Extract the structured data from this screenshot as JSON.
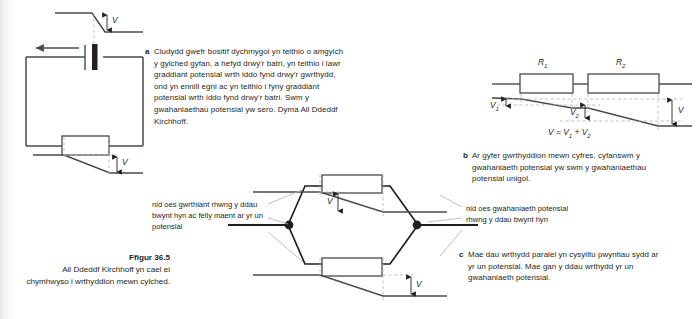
{
  "figure": {
    "caption_title": "Ffigur 36.5",
    "caption_body": "Ail Ddeddf Kirchhoff yn cael ei chymhwyso i wrthyddion mewn cylched."
  },
  "sections": {
    "a": {
      "marker": "a",
      "text": "Cludydd gwefr bositif dychmygol yn teithio o amgylch y gylched gyfan, a hefyd drwy'r batri, yn teithio i lawr graddiant potensial wrth iddo fynd drwy'r gwrthydd, ond yn ennill egni ac yn teithio i fyny graddiant potensial wrth iddo fynd drwy'r batri. Swm y gwahaniaethau potensial yw sero. Dyma Ail Ddeddf Kirchhoff."
    },
    "b": {
      "marker": "b",
      "text": "Ar gyfer gwrthyddion mewn cyfres, cyfanswm y gwahaniaeth potensial yw swm y gwahaniaethau potensial unigol."
    },
    "c": {
      "marker": "c",
      "text": "Mae dau wrthydd paralel yn cysylltu pwyntiau sydd ar yr un potensial. Mae gan y ddau wrthydd yr un gwahaniaeth potensial."
    }
  },
  "diagram_a": {
    "v_label_top": "V",
    "v_label_bottom": "V"
  },
  "diagram_b": {
    "resistor_1_label": "R",
    "resistor_1_sub": "1",
    "resistor_2_label": "R",
    "resistor_2_sub": "2",
    "v1_label": "V",
    "v1_sub": "1",
    "v2_label": "V",
    "v2_sub": "2",
    "v_total_label": "V",
    "equation_lhs": "V",
    "equation_op1": "=",
    "equation_t1": "V",
    "equation_t1_sub": "1",
    "equation_op2": "+",
    "equation_t2": "V",
    "equation_t2_sub": "2"
  },
  "diagram_c": {
    "v_label_top": "V",
    "v_label_bottom": "V",
    "callout_left": "nid oes gwrthiant rhwng y ddau bwynt hyn ac felly maent ar yr un potensial",
    "callout_right": "nid oes gwahaniaeth potensial rhwng y ddau bwynt hyn"
  },
  "colors": {
    "line": "#4a4a4a",
    "dark_line": "#231f20",
    "dashed": "#b9b9b9",
    "text": "#231f20"
  }
}
